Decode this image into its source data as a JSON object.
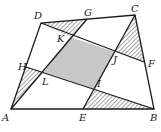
{
  "diagram": {
    "type": "geometry-quadrilateral",
    "colors": {
      "stroke": "#1a1a1a",
      "shaded": "#c8c8c8",
      "hatch": "#333333",
      "background": "#ffffff"
    },
    "vertices": {
      "A": [
        11,
        109
      ],
      "B": [
        154,
        109
      ],
      "C": [
        135,
        15
      ],
      "D": [
        41,
        23
      ]
    },
    "side_points": {
      "E": [
        83,
        109
      ],
      "F": [
        144,
        62
      ],
      "G": [
        87,
        19
      ],
      "H": [
        26,
        67
      ]
    },
    "inner_points": {
      "K": [
        70,
        37
      ],
      "J": [
        115,
        52
      ],
      "I": [
        95,
        89
      ],
      "L": [
        44,
        72
      ]
    },
    "segments": [
      [
        "D",
        "F"
      ],
      [
        "H",
        "B"
      ],
      [
        "A",
        "G"
      ],
      [
        "E",
        "C"
      ]
    ],
    "shaded_region": [
      "K",
      "J",
      "I",
      "L"
    ],
    "hatched_triangles": [
      [
        "D",
        "G",
        "K"
      ],
      [
        "C",
        "F",
        "J"
      ],
      [
        "B",
        "E",
        "I"
      ],
      [
        "A",
        "H",
        "L"
      ]
    ],
    "labels": [
      {
        "text": "A",
        "x": 2,
        "y": 121
      },
      {
        "text": "B",
        "x": 150,
        "y": 121
      },
      {
        "text": "C",
        "x": 131,
        "y": 12
      },
      {
        "text": "D",
        "x": 34,
        "y": 19
      },
      {
        "text": "E",
        "x": 79,
        "y": 121
      },
      {
        "text": "F",
        "x": 148,
        "y": 67
      },
      {
        "text": "G",
        "x": 84,
        "y": 16
      },
      {
        "text": "H",
        "x": 18,
        "y": 70
      },
      {
        "text": "K",
        "x": 57,
        "y": 42
      },
      {
        "text": "J",
        "x": 113,
        "y": 63
      },
      {
        "text": "I",
        "x": 97,
        "y": 87
      },
      {
        "text": "L",
        "x": 42,
        "y": 85
      }
    ]
  }
}
